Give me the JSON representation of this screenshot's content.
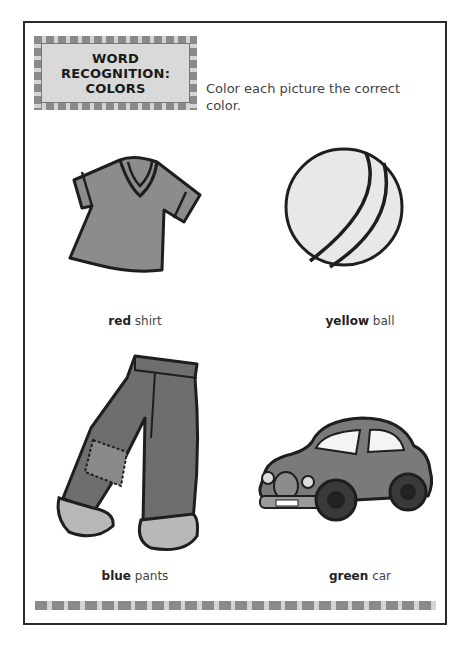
{
  "header": {
    "badge_title_line1": "WORD",
    "badge_title_line2": "RECOGNITION:",
    "badge_title_line3": "COLORS",
    "instructions": "Color each picture the correct color."
  },
  "items": [
    {
      "name": "shirt",
      "color_word": "red",
      "object_word": "shirt",
      "icon": "shirt-icon"
    },
    {
      "name": "ball",
      "color_word": "yellow",
      "object_word": "ball",
      "icon": "ball-icon"
    },
    {
      "name": "pants",
      "color_word": "blue",
      "object_word": "pants",
      "icon": "pants-icon"
    },
    {
      "name": "car",
      "color_word": "green",
      "object_word": "car",
      "icon": "car-icon"
    }
  ],
  "colors": {
    "frame": "#2b2b2b",
    "tile_dark": "#8a8a8a",
    "tile_light": "#d4d4d4",
    "badge_fill": "#d9d9d9",
    "shirt_fill": "#8c8c8c",
    "ball_fill": "#e8e8e8",
    "pants_fill": "#6e6e6e",
    "car_fill": "#7a7a7a"
  }
}
